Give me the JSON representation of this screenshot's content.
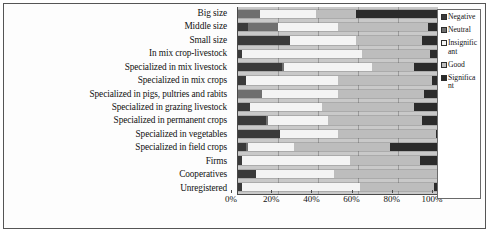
{
  "figure": {
    "title": ""
  },
  "legend": {
    "position": "right",
    "items": [
      {
        "label": "Negative",
        "key": "negative",
        "color": "#3a3a3a"
      },
      {
        "label": "Neutral",
        "key": "neutral",
        "color": "#6f6f6f"
      },
      {
        "label": "Insignificant",
        "key": "insignificant",
        "color": "#f4f4f4"
      },
      {
        "label": "Good",
        "key": "good",
        "color": "#bdbdbd"
      },
      {
        "label": "Significant",
        "key": "significant",
        "color": "#2b2b2b"
      }
    ]
  },
  "axis": {
    "x_ticks": [
      "0%",
      "20%",
      "40%",
      "60%",
      "80%",
      "100%"
    ],
    "x_tick_values": [
      0,
      20,
      40,
      60,
      80,
      100
    ],
    "xlabel": "",
    "ylabel": ""
  },
  "chart_data": {
    "type": "bar",
    "orientation": "horizontal",
    "stacked": true,
    "normalized": true,
    "title": "",
    "xlabel": "",
    "ylabel": "",
    "xlim": [
      0,
      100
    ],
    "grid": true,
    "legend_position": "right",
    "categories": [
      "Big size",
      "Middle size",
      "Small size",
      "In mix crop-livestock",
      "Specialized in mix livestock",
      "Specialized in mix crops",
      "Specialized in pigs, pultries and rabits",
      "Specialized in grazing livestock",
      "Specialized in permanent crops",
      "Specialized in vegetables",
      "Specialized in field crops",
      "Firms",
      "Cooperatives",
      "Unregistered"
    ],
    "series": [
      {
        "name": "Negative",
        "values": [
          0,
          5,
          26,
          2,
          22,
          4,
          0,
          6,
          14,
          21,
          4,
          2,
          9,
          2
        ]
      },
      {
        "name": "Neutral",
        "values": [
          11,
          15,
          0,
          0,
          1,
          0,
          12,
          0,
          1,
          0,
          1,
          0,
          0,
          0
        ]
      },
      {
        "name": "Insignificant",
        "values": [
          28,
          30,
          33,
          60,
          44,
          46,
          38,
          36,
          30,
          29,
          23,
          54,
          39,
          59
        ]
      },
      {
        "name": "Good",
        "values": [
          20,
          45,
          33,
          34,
          21,
          47,
          43,
          46,
          47,
          49,
          48,
          35,
          52,
          37
        ]
      },
      {
        "name": "Significant",
        "values": [
          41,
          5,
          8,
          4,
          12,
          3,
          7,
          12,
          8,
          1,
          24,
          9,
          0,
          2
        ]
      }
    ]
  }
}
